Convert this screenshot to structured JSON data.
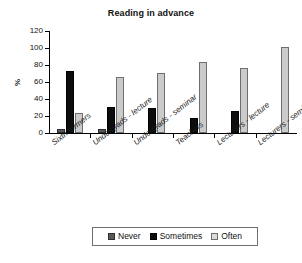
{
  "chart_data": {
    "type": "bar",
    "title": "Reading in advance",
    "xlabel": "",
    "ylabel": "%",
    "ylim": [
      0,
      120
    ],
    "ytick_values": [
      0,
      20,
      40,
      60,
      80,
      100,
      120
    ],
    "grid": false,
    "legend_position": "bottom",
    "categories": [
      "Sixth formers",
      "Undergrads - lecture",
      "Undergrads - seminar",
      "Teachers",
      "Lecturers - lecture",
      "Lecturers - seminar"
    ],
    "series": [
      {
        "name": "Never",
        "color": "#595959",
        "values": [
          5,
          5,
          0,
          0,
          0,
          0
        ]
      },
      {
        "name": "Sometimes",
        "color": "#0d0d0d",
        "values": [
          73,
          31,
          30,
          18,
          26,
          0
        ]
      },
      {
        "name": "Often",
        "color": "#cbcbcb",
        "values": [
          24,
          66,
          71,
          84,
          76,
          101
        ]
      }
    ]
  },
  "legend": {
    "items": [
      {
        "label": "Never"
      },
      {
        "label": "Sometimes"
      },
      {
        "label": "Often"
      }
    ]
  }
}
